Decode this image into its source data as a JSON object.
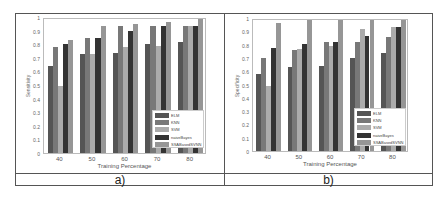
{
  "colors": {
    "ELM": "#555555",
    "KNN": "#787878",
    "SVM": "#ababab",
    "naiveBayes": "#333333",
    "SSABasedSVNN": "#969696"
  },
  "captions": {
    "a": "a)",
    "b": "b)"
  },
  "chart_data": [
    {
      "type": "bar",
      "title": "",
      "xlabel": "Training Percentage",
      "ylabel": "Sensitivity",
      "ylim": [
        0,
        1
      ],
      "yticks": [
        "0",
        "0.1",
        "0.2",
        "0.3",
        "0.4",
        "0.5",
        "0.6",
        "0.7",
        "0.8",
        "0.9",
        "1"
      ],
      "categories": [
        "40",
        "50",
        "60",
        "70",
        "80"
      ],
      "legend_position": "lower right",
      "series": [
        {
          "name": "ELM",
          "values": [
            0.65,
            0.74,
            0.75,
            0.81,
            0.83
          ]
        },
        {
          "name": "KNN",
          "values": [
            0.79,
            0.86,
            0.95,
            0.95,
            0.95
          ]
        },
        {
          "name": "SVM",
          "values": [
            0.5,
            0.74,
            0.79,
            0.8,
            0.95
          ]
        },
        {
          "name": "naiveBayes",
          "values": [
            0.81,
            0.86,
            0.91,
            0.95,
            0.95
          ]
        },
        {
          "name": "SSABasedSVNN",
          "values": [
            0.84,
            0.95,
            0.96,
            0.98,
            1.0
          ]
        }
      ],
      "caption": "a)"
    },
    {
      "type": "bar",
      "title": "",
      "xlabel": "Training Percentage",
      "ylabel": "Specificity",
      "ylim": [
        0,
        1
      ],
      "yticks": [
        "0",
        "0.1",
        "0.2",
        "0.3",
        "0.4",
        "0.5",
        "0.6",
        "0.7",
        "0.8",
        "0.9",
        "1"
      ],
      "categories": [
        "40",
        "50",
        "60",
        "70",
        "80"
      ],
      "legend_position": "lower right",
      "series": [
        {
          "name": "ELM",
          "values": [
            0.59,
            0.64,
            0.65,
            0.71,
            0.75
          ]
        },
        {
          "name": "KNN",
          "values": [
            0.71,
            0.77,
            0.83,
            0.83,
            0.87
          ]
        },
        {
          "name": "SVM",
          "values": [
            0.5,
            0.78,
            0.8,
            0.93,
            0.95
          ]
        },
        {
          "name": "naiveBayes",
          "values": [
            0.79,
            0.82,
            0.83,
            0.88,
            0.95
          ]
        },
        {
          "name": "SSABasedSVNN",
          "values": [
            0.98,
            1.0,
            1.0,
            1.0,
            1.0
          ]
        }
      ],
      "caption": "b)"
    }
  ]
}
